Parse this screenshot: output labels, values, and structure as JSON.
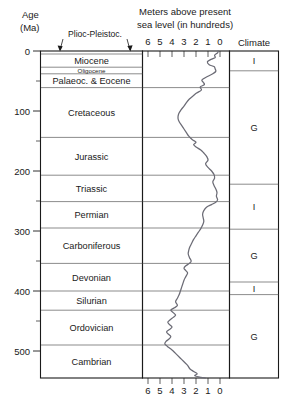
{
  "header": {
    "age_label_line1": "Age",
    "age_label_line2": "(Ma)",
    "sea_label_line1": "Meters above present",
    "sea_label_line2": "sea level (in hundreds)",
    "climate_label": "Climate",
    "leader_label": "Plioc-Pleistoc."
  },
  "chart_data": {
    "type": "line",
    "title": "Meters above present sea level (in hundreds)",
    "xlabel": "Meters above present sea level (in hundreds)",
    "ylabel": "Age (Ma)",
    "xlim": [
      6,
      0
    ],
    "ylim": [
      0,
      545
    ],
    "x_ticks": [
      6,
      5,
      4,
      3,
      2,
      1,
      0
    ],
    "x_tick_labels": [
      "6",
      "5",
      "4",
      "3",
      "2",
      "1",
      "0"
    ],
    "y_ticks": [
      0,
      100,
      200,
      300,
      400,
      500
    ],
    "y_tick_labels": [
      "0",
      "100",
      "200",
      "300",
      "400",
      "500"
    ],
    "y_minor_ticks": [
      50,
      150,
      250,
      350,
      450
    ],
    "grid": true,
    "axis_direction": "x reversed (6 at left, 0 at right); y inverted (0 at top)",
    "series": [
      {
        "name": "Sea level",
        "points": [
          [
            0,
            0.15
          ],
          [
            3,
            0.2
          ],
          [
            7,
            0.45
          ],
          [
            11,
            0.4
          ],
          [
            14,
            0.75
          ],
          [
            18,
            1.05
          ],
          [
            23,
            0.9
          ],
          [
            26,
            0.5
          ],
          [
            30,
            0.4
          ],
          [
            34,
            0.35
          ],
          [
            38,
            0.6
          ],
          [
            42,
            1.0
          ],
          [
            48,
            1.5
          ],
          [
            52,
            1.4
          ],
          [
            56,
            1.3
          ],
          [
            60,
            1.65
          ],
          [
            65,
            1.55
          ],
          [
            70,
            1.95
          ],
          [
            75,
            2.25
          ],
          [
            80,
            2.55
          ],
          [
            86,
            2.8
          ],
          [
            92,
            3.0
          ],
          [
            98,
            3.25
          ],
          [
            105,
            3.45
          ],
          [
            112,
            3.5
          ],
          [
            118,
            3.4
          ],
          [
            124,
            3.2
          ],
          [
            130,
            3.0
          ],
          [
            136,
            2.8
          ],
          [
            142,
            2.6
          ],
          [
            148,
            2.3
          ],
          [
            152,
            2.0
          ],
          [
            156,
            2.2
          ],
          [
            160,
            2.0
          ],
          [
            165,
            1.6
          ],
          [
            170,
            1.35
          ],
          [
            176,
            1.1
          ],
          [
            182,
            1.0
          ],
          [
            188,
            1.2
          ],
          [
            194,
            1.0
          ],
          [
            200,
            0.7
          ],
          [
            206,
            0.5
          ],
          [
            212,
            0.45
          ],
          [
            218,
            0.6
          ],
          [
            224,
            0.5
          ],
          [
            230,
            0.35
          ],
          [
            236,
            0.25
          ],
          [
            242,
            0.3
          ],
          [
            248,
            0.2
          ],
          [
            252,
            0.35
          ],
          [
            256,
            0.7
          ],
          [
            260,
            1.1
          ],
          [
            266,
            1.35
          ],
          [
            272,
            1.45
          ],
          [
            278,
            1.4
          ],
          [
            284,
            1.35
          ],
          [
            290,
            1.45
          ],
          [
            296,
            1.6
          ],
          [
            302,
            1.8
          ],
          [
            308,
            2.0
          ],
          [
            314,
            2.2
          ],
          [
            320,
            2.35
          ],
          [
            326,
            2.5
          ],
          [
            332,
            2.6
          ],
          [
            338,
            2.65
          ],
          [
            344,
            2.55
          ],
          [
            350,
            2.4
          ],
          [
            354,
            2.55
          ],
          [
            358,
            2.85
          ],
          [
            362,
            3.0
          ],
          [
            366,
            2.85
          ],
          [
            370,
            2.7
          ],
          [
            376,
            2.85
          ],
          [
            382,
            3.0
          ],
          [
            388,
            3.1
          ],
          [
            394,
            3.2
          ],
          [
            400,
            3.3
          ],
          [
            406,
            3.4
          ],
          [
            412,
            3.55
          ],
          [
            418,
            3.7
          ],
          [
            424,
            3.55
          ],
          [
            428,
            3.8
          ],
          [
            432,
            4.1
          ],
          [
            436,
            3.9
          ],
          [
            440,
            3.7
          ],
          [
            444,
            3.9
          ],
          [
            448,
            4.15
          ],
          [
            452,
            4.35
          ],
          [
            456,
            4.2
          ],
          [
            460,
            4.0
          ],
          [
            464,
            4.2
          ],
          [
            468,
            4.45
          ],
          [
            472,
            4.3
          ],
          [
            476,
            4.1
          ],
          [
            480,
            4.25
          ],
          [
            484,
            4.5
          ],
          [
            488,
            4.6
          ],
          [
            492,
            4.4
          ],
          [
            496,
            4.15
          ],
          [
            500,
            3.9
          ],
          [
            506,
            3.6
          ],
          [
            512,
            3.3
          ],
          [
            518,
            3.0
          ],
          [
            524,
            2.7
          ],
          [
            530,
            2.5
          ],
          [
            534,
            2.2
          ],
          [
            538,
            1.9
          ],
          [
            541,
            2.1
          ],
          [
            544,
            1.6
          ],
          [
            545,
            1.2
          ]
        ]
      }
    ]
  },
  "periods": [
    {
      "name": "Plioc-Pleistoc.",
      "display": "",
      "top": 0,
      "bottom": 5,
      "size": "small"
    },
    {
      "name": "Miocene",
      "display": "Miocene",
      "top": 5,
      "bottom": 27,
      "size": "normal"
    },
    {
      "name": "Oligocene",
      "display": "Oligocene",
      "top": 27,
      "bottom": 38,
      "size": "small"
    },
    {
      "name": "Palaeoc. & Eocene",
      "display": "Palaeoc. & Eocene",
      "top": 38,
      "bottom": 61,
      "size": "normal"
    },
    {
      "name": "Cretaceous",
      "display": "Cretaceous",
      "top": 61,
      "bottom": 144,
      "size": "normal"
    },
    {
      "name": "Jurassic",
      "display": "Jurassic",
      "top": 144,
      "bottom": 207,
      "size": "normal"
    },
    {
      "name": "Triassic",
      "display": "Triassic",
      "top": 207,
      "bottom": 251,
      "size": "normal"
    },
    {
      "name": "Permian",
      "display": "Permian",
      "top": 251,
      "bottom": 295,
      "size": "normal"
    },
    {
      "name": "Carboniferous",
      "display": "Carboniferous",
      "top": 295,
      "bottom": 354,
      "size": "normal"
    },
    {
      "name": "Devonian",
      "display": "Devonian",
      "top": 354,
      "bottom": 400,
      "size": "normal"
    },
    {
      "name": "Silurian",
      "display": "Silurian",
      "top": 400,
      "bottom": 432,
      "size": "normal"
    },
    {
      "name": "Ordovician",
      "display": "Ordovician",
      "top": 432,
      "bottom": 490,
      "size": "normal"
    },
    {
      "name": "Cambrian",
      "display": "Cambrian",
      "top": 490,
      "bottom": 545,
      "size": "normal"
    }
  ],
  "climate_bands": [
    {
      "label": "I",
      "top": 0,
      "bottom": 33
    },
    {
      "label": "G",
      "top": 33,
      "bottom": 222
    },
    {
      "label": "I",
      "top": 222,
      "bottom": 297
    },
    {
      "label": "G",
      "top": 297,
      "bottom": 385
    },
    {
      "label": "I",
      "top": 385,
      "bottom": 406
    },
    {
      "label": "G",
      "top": 406,
      "bottom": 545
    }
  ]
}
